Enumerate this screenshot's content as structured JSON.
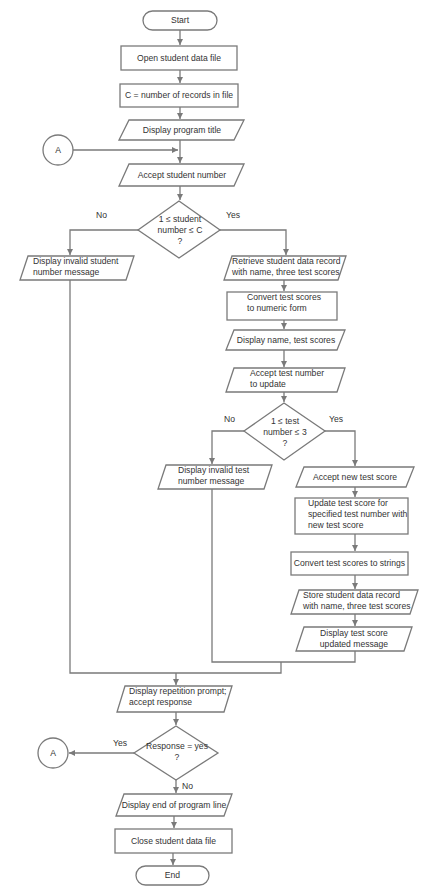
{
  "diagram": {
    "type": "flowchart",
    "connector_label": "A",
    "nodes": {
      "start": "Start",
      "open_file": "Open student data file",
      "count_records": "C = number of records in file",
      "display_title": "Display program title",
      "accept_student": "Accept student number",
      "decision_student": [
        "1 ≤ student",
        "number ≤ C",
        "?"
      ],
      "invalid_student": [
        "Display invalid student",
        "number message"
      ],
      "retrieve_record": [
        "Retrieve student data record",
        "with name, three test scores"
      ],
      "convert_numeric": [
        "Convert test scores",
        "to numeric form"
      ],
      "display_scores": "Display name, test scores",
      "accept_test_number": [
        "Accept test number",
        "to update"
      ],
      "decision_test": [
        "1 ≤ test",
        "number ≤ 3",
        "?"
      ],
      "invalid_test": [
        "Display invalid test",
        "number message"
      ],
      "accept_new_score": "Accept new test score",
      "update_score": [
        "Update test score for",
        "specified test number with",
        "new test score"
      ],
      "convert_strings": "Convert test scores to strings",
      "store_record": [
        "Store student data record",
        "with name, three test scores"
      ],
      "display_updated": [
        "Display test score",
        "updated message"
      ],
      "repetition_prompt": [
        "Display repetition prompt;",
        "accept response"
      ],
      "decision_response": [
        "Response = yes",
        "?"
      ],
      "display_end": "Display end of program line",
      "close_file": "Close student data file",
      "end": "End"
    },
    "edge_labels": {
      "student_no": "No",
      "student_yes": "Yes",
      "test_no": "No",
      "test_yes": "Yes",
      "response_yes": "Yes",
      "response_no": "No"
    },
    "colors": {
      "stroke": "#7a7a7a",
      "text": "#333333",
      "background": "#ffffff"
    }
  }
}
